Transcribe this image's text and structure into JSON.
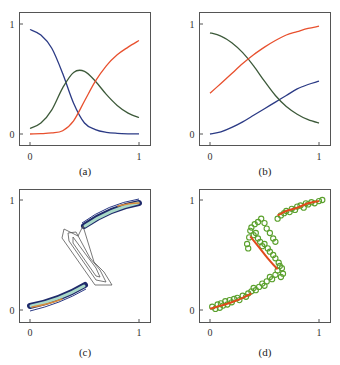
{
  "figure": {
    "panels": [
      {
        "id": "a",
        "caption": "(a)",
        "xticks": [
          "0",
          "1"
        ],
        "yticks": [
          "0",
          "1"
        ]
      },
      {
        "id": "b",
        "caption": "(b)",
        "xticks": [
          "0",
          "1"
        ],
        "yticks": [
          "0",
          "1"
        ]
      },
      {
        "id": "c",
        "caption": "(c)",
        "xticks": [
          "0",
          "1"
        ],
        "yticks": [
          "0",
          "1"
        ]
      },
      {
        "id": "d",
        "caption": "(d)",
        "xticks": [
          "0",
          "1"
        ],
        "yticks": [
          "0",
          "1"
        ]
      }
    ]
  },
  "colors": {
    "blue": "#2b3a85",
    "green": "#3d5a3a",
    "red": "#e8502e",
    "scatter_green": "#5aa02c",
    "fit_red": "#e04a1c",
    "contour_dark": "#1f2a6b",
    "contour_light": "#a9d9c8",
    "contour_orange": "#d98a3a",
    "contour_gray": "#555555"
  },
  "chart_data": [
    {
      "panel": "a",
      "type": "line",
      "title": "",
      "caption": "(a)",
      "xlabel": "",
      "ylabel": "",
      "xlim": [
        0,
        1
      ],
      "ylim": [
        0,
        1
      ],
      "xticks": [
        0,
        1
      ],
      "yticks": [
        0,
        1
      ],
      "grid": false,
      "x": [
        0,
        0.1,
        0.2,
        0.3,
        0.4,
        0.5,
        0.6,
        0.7,
        0.8,
        0.9,
        1.0
      ],
      "series": [
        {
          "name": "blue",
          "color": "#2b3a85",
          "values": [
            0.95,
            0.9,
            0.78,
            0.55,
            0.28,
            0.1,
            0.04,
            0.015,
            0.006,
            0.002,
            0.001
          ]
        },
        {
          "name": "green",
          "color": "#3d5a3a",
          "values": [
            0.05,
            0.1,
            0.22,
            0.42,
            0.56,
            0.57,
            0.48,
            0.36,
            0.26,
            0.19,
            0.15
          ]
        },
        {
          "name": "red",
          "color": "#e8502e",
          "values": [
            0.0,
            0.003,
            0.01,
            0.03,
            0.12,
            0.3,
            0.48,
            0.62,
            0.72,
            0.79,
            0.85
          ]
        }
      ]
    },
    {
      "panel": "b",
      "type": "line",
      "title": "",
      "caption": "(b)",
      "xlabel": "",
      "ylabel": "",
      "xlim": [
        0,
        1
      ],
      "ylim": [
        0,
        1
      ],
      "xticks": [
        0,
        1
      ],
      "yticks": [
        0,
        1
      ],
      "grid": false,
      "x": [
        0,
        0.1,
        0.2,
        0.3,
        0.4,
        0.5,
        0.6,
        0.7,
        0.8,
        0.9,
        1.0
      ],
      "series": [
        {
          "name": "blue",
          "color": "#2b3a85",
          "values": [
            0.0,
            0.02,
            0.06,
            0.11,
            0.17,
            0.23,
            0.29,
            0.35,
            0.41,
            0.45,
            0.48
          ]
        },
        {
          "name": "green",
          "color": "#3d5a3a",
          "values": [
            0.92,
            0.89,
            0.83,
            0.74,
            0.62,
            0.48,
            0.35,
            0.25,
            0.18,
            0.13,
            0.1
          ]
        },
        {
          "name": "red",
          "color": "#e8502e",
          "values": [
            0.37,
            0.46,
            0.55,
            0.64,
            0.72,
            0.79,
            0.85,
            0.9,
            0.93,
            0.96,
            0.98
          ]
        }
      ]
    },
    {
      "panel": "c",
      "type": "contour",
      "title": "",
      "caption": "(c)",
      "xlabel": "",
      "ylabel": "",
      "xlim": [
        0,
        1
      ],
      "ylim": [
        0,
        1
      ],
      "xticks": [
        0,
        1
      ],
      "yticks": [
        0,
        1
      ],
      "grid": false,
      "description": "Density contours along an inverted S-shaped curve; tight high-density bands near (0,0)-(0.5,0.25) and (0.5,0.75)-(1,1), looser gray contours in the middle fold region from x≈0.3 to x≈0.75."
    },
    {
      "panel": "d",
      "type": "scatter",
      "title": "",
      "caption": "(d)",
      "xlabel": "",
      "ylabel": "",
      "xlim": [
        0,
        1.05
      ],
      "ylim": [
        0,
        1
      ],
      "xticks": [
        0,
        1
      ],
      "yticks": [
        0,
        1
      ],
      "grid": false,
      "series": [
        {
          "name": "data points",
          "color": "#5aa02c",
          "marker": "open-circle",
          "points": [
            [
              0.02,
              0.03
            ],
            [
              0.05,
              0.01
            ],
            [
              0.07,
              0.05
            ],
            [
              0.09,
              0.02
            ],
            [
              0.1,
              0.06
            ],
            [
              0.12,
              0.04
            ],
            [
              0.14,
              0.08
            ],
            [
              0.16,
              0.05
            ],
            [
              0.18,
              0.09
            ],
            [
              0.2,
              0.07
            ],
            [
              0.22,
              0.1
            ],
            [
              0.25,
              0.11
            ],
            [
              0.27,
              0.09
            ],
            [
              0.3,
              0.13
            ],
            [
              0.33,
              0.12
            ],
            [
              0.35,
              0.15
            ],
            [
              0.38,
              0.17
            ],
            [
              0.4,
              0.2
            ],
            [
              0.42,
              0.18
            ],
            [
              0.45,
              0.21
            ],
            [
              0.48,
              0.24
            ],
            [
              0.5,
              0.22
            ],
            [
              0.52,
              0.26
            ],
            [
              0.55,
              0.3
            ],
            [
              0.57,
              0.28
            ],
            [
              0.6,
              0.32
            ],
            [
              0.62,
              0.36
            ],
            [
              0.64,
              0.4
            ],
            [
              0.66,
              0.38
            ],
            [
              0.67,
              0.33
            ],
            [
              0.65,
              0.3
            ],
            [
              0.63,
              0.43
            ],
            [
              0.6,
              0.47
            ],
            [
              0.58,
              0.5
            ],
            [
              0.55,
              0.53
            ],
            [
              0.53,
              0.56
            ],
            [
              0.5,
              0.6
            ],
            [
              0.48,
              0.58
            ],
            [
              0.46,
              0.62
            ],
            [
              0.44,
              0.65
            ],
            [
              0.42,
              0.7
            ],
            [
              0.4,
              0.68
            ],
            [
              0.37,
              0.72
            ],
            [
              0.36,
              0.66
            ],
            [
              0.34,
              0.6
            ],
            [
              0.35,
              0.56
            ],
            [
              0.38,
              0.75
            ],
            [
              0.41,
              0.78
            ],
            [
              0.44,
              0.8
            ],
            [
              0.47,
              0.83
            ],
            [
              0.5,
              0.79
            ],
            [
              0.52,
              0.74
            ],
            [
              0.55,
              0.7
            ],
            [
              0.58,
              0.65
            ],
            [
              0.6,
              0.62
            ],
            [
              0.62,
              0.83
            ],
            [
              0.65,
              0.86
            ],
            [
              0.68,
              0.88
            ],
            [
              0.7,
              0.9
            ],
            [
              0.73,
              0.89
            ],
            [
              0.75,
              0.92
            ],
            [
              0.78,
              0.91
            ],
            [
              0.8,
              0.94
            ],
            [
              0.83,
              0.95
            ],
            [
              0.86,
              0.93
            ],
            [
              0.88,
              0.97
            ],
            [
              0.9,
              0.96
            ],
            [
              0.93,
              0.98
            ],
            [
              0.96,
              0.97
            ],
            [
              1.0,
              0.99
            ],
            [
              1.03,
              1.0
            ]
          ]
        },
        {
          "name": "fit",
          "color": "#e04a1c",
          "type": "line-segments",
          "segments": [
            [
              [
                0,
                0.01
              ],
              [
                0.1,
                0.04
              ],
              [
                0.2,
                0.07
              ],
              [
                0.3,
                0.11
              ],
              [
                0.38,
                0.15
              ]
            ],
            [
              [
                0.37,
                0.67
              ],
              [
                0.45,
                0.57
              ],
              [
                0.53,
                0.47
              ],
              [
                0.62,
                0.37
              ]
            ],
            [
              [
                0.62,
                0.86
              ],
              [
                0.7,
                0.9
              ],
              [
                0.8,
                0.93
              ],
              [
                0.9,
                0.97
              ],
              [
                1.0,
                0.99
              ]
            ]
          ]
        }
      ]
    }
  ]
}
